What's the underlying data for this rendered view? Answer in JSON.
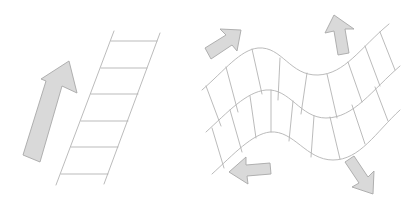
{
  "diagram": {
    "colors": {
      "background": "#ffffff",
      "arrow_fill": "#d9d9d9",
      "arrow_stroke": "#a8a8a8",
      "line_stroke": "#b3b3b3"
    },
    "left_panel": {
      "arrow": {
        "icon": "arrow-up-right-icon",
        "direction": "up-right"
      },
      "ladder": {
        "rungs": 6
      }
    },
    "right_panel": {
      "wave_grid": {
        "rows": 2,
        "columns": 9
      },
      "arrows": [
        {
          "icon": "arrow-up-right-icon",
          "direction": "up-right",
          "position": "top-left"
        },
        {
          "icon": "arrow-up-icon",
          "direction": "up",
          "position": "top-right"
        },
        {
          "icon": "arrow-left-icon",
          "direction": "left",
          "position": "bottom-left"
        },
        {
          "icon": "arrow-down-right-icon",
          "direction": "down-right",
          "position": "bottom-right"
        }
      ]
    }
  }
}
